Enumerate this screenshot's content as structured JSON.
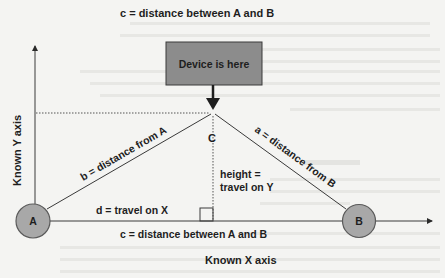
{
  "diagram": {
    "title": "c = distance between A and B",
    "device_box": {
      "label": "Device is here",
      "fill": "#8c8c8c"
    },
    "points": {
      "A": {
        "label": "A",
        "fill": "#a8a8a8"
      },
      "B": {
        "label": "B",
        "fill": "#a8a8a8"
      },
      "C": {
        "label": "C"
      }
    },
    "edges": {
      "b": "b = distance from A",
      "a": "a = distance from B",
      "d": "d = travel on X",
      "height_line1": "height =",
      "height_line2": "travel on Y",
      "c_bottom": "c = distance between A and B"
    },
    "axes": {
      "y_label": "Known Y axis",
      "x_label": "Known X axis"
    },
    "colors": {
      "line": "#3a3a3a",
      "text": "#1e1e1e",
      "background": "#f4f4f2",
      "box": "#8c8c8c",
      "circle": "#a8a8a8"
    }
  }
}
